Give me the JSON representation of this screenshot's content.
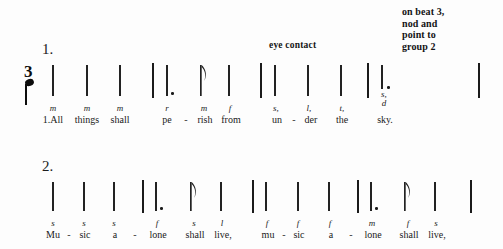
{
  "annotations": {
    "right_note": "on beat 3,\nnod and\npoint to\ngroup 2",
    "eye_contact": "eye contact"
  },
  "time_signature": {
    "top": "3",
    "bottom_symbol": "quarter-note"
  },
  "systems": [
    {
      "number_label": "1.",
      "solfa": [
        "m",
        "m",
        "m",
        "r",
        "m",
        "f",
        "s,",
        "l,",
        "t,",
        "s,"
      ],
      "below_note": "d",
      "lyrics": [
        "1.All",
        "things",
        "shall",
        "pe",
        "rish",
        "from",
        "un",
        "der",
        "the",
        "sky."
      ],
      "hyphens": [
        "-",
        "-"
      ]
    },
    {
      "number_label": "2.",
      "solfa": [
        "s",
        "s",
        "s",
        "f",
        "s",
        "l",
        "f",
        "f",
        "f",
        "m",
        "f",
        "s"
      ],
      "lyrics": [
        "Mu",
        "sic",
        "a",
        "lone",
        "shall",
        "live,",
        "mu",
        "sic",
        "a",
        "lone",
        "shall",
        "live,"
      ],
      "hyphens": [
        "-",
        "-",
        "-",
        "-"
      ]
    }
  ]
}
